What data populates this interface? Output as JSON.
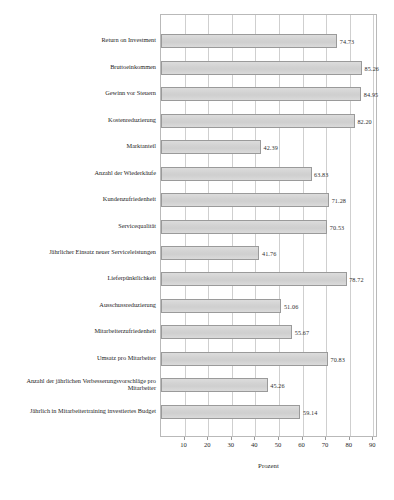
{
  "chart_data": {
    "type": "bar",
    "orientation": "horizontal",
    "title": "",
    "xlabel": "Prozent",
    "ylabel": "",
    "xlim": [
      0,
      92
    ],
    "xticks": [
      10,
      20,
      30,
      40,
      50,
      60,
      70,
      80,
      90
    ],
    "grid": true,
    "legend": null,
    "categories": [
      "Return on Investment",
      "Bruttoeinkommen",
      "Gewinn vor Steuern",
      "Kostenreduzierung",
      "Marktanteil",
      "Anzahl der Wiederkäufe",
      "Kundenzufriedenheit",
      "Servicequalität",
      "Jährlicher Einsatz neuer Serviceleistungen",
      "Lieferpünktlichkeit",
      "Ausschussreduzierung",
      "Mitarbeiterzufriedenheit",
      "Umsatz pro Mitarbeiter",
      "Anzahl der jährlichen Verbesserungsvorschläge pro Mitarbeiter",
      "Jährlich in Mitarbeitertraining investiertes Budget"
    ],
    "values": [
      74.73,
      85.26,
      84.95,
      82.2,
      42.39,
      63.83,
      71.28,
      70.53,
      41.76,
      78.72,
      51.06,
      55.67,
      70.83,
      45.26,
      59.14
    ],
    "value_labels": [
      "74.73",
      "85.26",
      "84.95",
      "82.20",
      "42.39",
      "63.83",
      "71.28",
      "70.53",
      "41.76",
      "78.72",
      "51.06",
      "55.67",
      "70.83",
      "45.26",
      "59.14"
    ],
    "tick_labels": [
      "10",
      "20",
      "30",
      "40",
      "50",
      "60",
      "70",
      "80",
      "90"
    ]
  },
  "colors": {
    "bar_fill": "#d4d4d4",
    "bar_border": "#9a9a9a",
    "gridline": "#cfcfcf",
    "frame": "#b9b9b9",
    "text": "#2b2b2b",
    "background": "#ffffff"
  }
}
